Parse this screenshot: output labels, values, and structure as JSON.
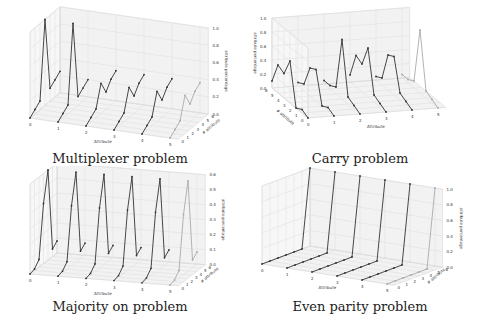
{
  "chart_data": [
    {
      "type": "line",
      "title": "Multiplexer problem",
      "xlabel": "Attribute",
      "ylabel": "# attribute",
      "zlabel": "attribute percentage",
      "x_ticks": [
        "0",
        "1",
        "2",
        "3",
        "4",
        "5"
      ],
      "y_ticks": [
        "0",
        "1",
        "2",
        "3",
        "4",
        "5",
        "6"
      ],
      "z_ticks": [
        "0.0",
        "0.2",
        "0.4",
        "0.6",
        "0.8",
        "1.0"
      ],
      "zlim": [
        0,
        1.0
      ],
      "series": [
        {
          "name": "attr 0",
          "values": [
            0.0,
            0.05,
            0.1,
            1.0,
            0.15,
            0.2,
            0.25
          ]
        },
        {
          "name": "attr 1",
          "values": [
            0.0,
            0.05,
            0.1,
            1.0,
            0.1,
            0.15,
            0.2
          ]
        },
        {
          "name": "attr 2",
          "values": [
            0.0,
            0.05,
            0.1,
            0.35,
            0.2,
            0.3,
            0.35
          ]
        },
        {
          "name": "attr 3",
          "values": [
            0.0,
            0.05,
            0.1,
            0.35,
            0.2,
            0.3,
            0.35
          ]
        },
        {
          "name": "attr 4",
          "values": [
            0.0,
            0.05,
            0.1,
            0.35,
            0.2,
            0.3,
            0.35
          ]
        },
        {
          "name": "attr 5",
          "values": [
            0.0,
            0.05,
            0.1,
            0.35,
            0.2,
            0.3,
            0.35
          ]
        }
      ]
    },
    {
      "type": "line",
      "title": "Carry problem",
      "xlabel": "Attribute",
      "ylabel": "# attribute",
      "zlabel": "attribute percentage",
      "x_ticks": [
        "0",
        "1",
        "2",
        "3",
        "4",
        "5"
      ],
      "y_ticks": [
        "0",
        "1",
        "2",
        "3",
        "4",
        "5",
        "6"
      ],
      "z_ticks": [
        "0.0",
        "0.2",
        "0.4",
        "0.6",
        "0.8",
        "1.0"
      ],
      "zlim": [
        0,
        1.0
      ],
      "series": [
        {
          "name": "attr 0",
          "values": [
            0.0,
            0.05,
            0.0,
            0.6,
            0.35,
            0.4,
            0.1
          ]
        },
        {
          "name": "attr 1",
          "values": [
            0.0,
            0.05,
            0.0,
            0.45,
            0.4,
            0.1,
            0.05
          ]
        },
        {
          "name": "attr 2",
          "values": [
            0.0,
            0.05,
            0.1,
            0.85,
            0.1,
            0.05,
            0.05
          ]
        },
        {
          "name": "attr 3",
          "values": [
            0.0,
            0.05,
            0.1,
            0.7,
            0.4,
            0.45,
            0.1
          ]
        },
        {
          "name": "attr 4",
          "values": [
            0.0,
            0.05,
            0.1,
            0.55,
            0.5,
            0.1,
            0.05
          ]
        },
        {
          "name": "attr 5",
          "values": [
            0.0,
            0.05,
            0.1,
            0.9,
            0.1,
            0.05,
            0.05
          ]
        }
      ]
    },
    {
      "type": "line",
      "title": "Majority on problem",
      "xlabel": "Attribute",
      "ylabel": "# attribute",
      "zlabel": "attribute percentage",
      "x_ticks": [
        "0",
        "1",
        "2",
        "3",
        "4",
        "5"
      ],
      "y_ticks": [
        "0",
        "1",
        "2",
        "3",
        "4",
        "5",
        "6"
      ],
      "z_ticks": [
        "0.0",
        "0.1",
        "0.2",
        "0.3",
        "0.4",
        "0.5",
        "0.6"
      ],
      "zlim": [
        0,
        0.6
      ],
      "series": [
        {
          "name": "attr 0",
          "values": [
            0.0,
            0.01,
            0.05,
            0.4,
            0.6,
            0.05,
            0.08
          ]
        },
        {
          "name": "attr 1",
          "values": [
            0.0,
            0.01,
            0.05,
            0.4,
            0.6,
            0.05,
            0.08
          ]
        },
        {
          "name": "attr 2",
          "values": [
            0.0,
            0.01,
            0.05,
            0.4,
            0.6,
            0.05,
            0.08
          ]
        },
        {
          "name": "attr 3",
          "values": [
            0.0,
            0.01,
            0.05,
            0.4,
            0.6,
            0.05,
            0.08
          ]
        },
        {
          "name": "attr 4",
          "values": [
            0.0,
            0.01,
            0.05,
            0.4,
            0.6,
            0.05,
            0.08
          ]
        },
        {
          "name": "attr 5",
          "values": [
            0.0,
            0.01,
            0.05,
            0.4,
            0.6,
            0.05,
            0.08
          ]
        }
      ]
    },
    {
      "type": "line",
      "title": "Even parity problem",
      "xlabel": "Attribute",
      "ylabel": "# attribute",
      "zlabel": "attribute percentage",
      "x_ticks": [
        "0",
        "1",
        "2",
        "3",
        "4",
        "5"
      ],
      "y_ticks": [
        "0",
        "1",
        "2",
        "3",
        "4",
        "5",
        "6"
      ],
      "z_ticks": [
        "0.0",
        "0.2",
        "0.4",
        "0.6",
        "0.8",
        "1.0"
      ],
      "zlim": [
        0,
        1.0
      ],
      "series": [
        {
          "name": "attr 0",
          "values": [
            0.0,
            0.0,
            0.0,
            0.0,
            0.0,
            0.0,
            1.0
          ]
        },
        {
          "name": "attr 1",
          "values": [
            0.0,
            0.0,
            0.0,
            0.0,
            0.0,
            0.0,
            1.0
          ]
        },
        {
          "name": "attr 2",
          "values": [
            0.0,
            0.0,
            0.0,
            0.0,
            0.0,
            0.0,
            1.0
          ]
        },
        {
          "name": "attr 3",
          "values": [
            0.0,
            0.0,
            0.0,
            0.0,
            0.0,
            0.0,
            1.0
          ]
        },
        {
          "name": "attr 4",
          "values": [
            0.0,
            0.0,
            0.0,
            0.0,
            0.0,
            0.0,
            1.0
          ]
        },
        {
          "name": "attr 5",
          "values": [
            0.0,
            0.0,
            0.0,
            0.0,
            0.0,
            0.0,
            1.0
          ]
        }
      ]
    }
  ],
  "colors": {
    "line": "#333333",
    "grid": "#dddddd",
    "pane": "#f2f2f2",
    "faded": "#aaaaaa"
  }
}
